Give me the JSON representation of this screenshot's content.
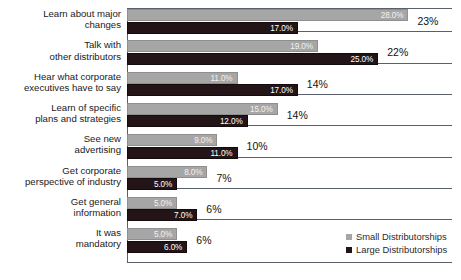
{
  "chart_data": {
    "type": "bar",
    "orientation": "horizontal",
    "title": "",
    "xlabel": "",
    "ylabel": "",
    "grid": false,
    "legend_position": "bottom-right",
    "xlim": [
      0,
      30
    ],
    "categories": [
      "Learn about major\nchanges",
      "Talk with\nother distributors",
      "Hear what corporate\nexecutives have to say",
      "Learn of specific\nplans and strategies",
      "See new\nadvertising",
      "Get corporate\nperspective of industry",
      "Get general\ninformation",
      "It was\nmandatory"
    ],
    "series": [
      {
        "name": "Small Distributorships",
        "color": "#a6a6a6",
        "values": [
          28.0,
          19.0,
          11.0,
          15.0,
          9.0,
          8.0,
          5.0,
          5.0
        ],
        "labels": [
          "28.0%",
          "19.0%",
          "11.0%",
          "15.0%",
          "9.0%",
          "8.0%",
          "5.0%",
          "5.0%"
        ]
      },
      {
        "name": "Large Distributorships",
        "color": "#231417",
        "values": [
          17.0,
          25.0,
          17.0,
          12.0,
          11.0,
          5.0,
          7.0,
          6.0
        ],
        "labels": [
          "17.0%",
          "25.0%",
          "17.0%",
          "12.0%",
          "11.0%",
          "5.0%",
          "7.0%",
          "6.0%"
        ]
      }
    ],
    "totals": [
      "23%",
      "22%",
      "14%",
      "14%",
      "10%",
      "7%",
      "6%",
      "6%"
    ]
  },
  "legend": {
    "items": [
      {
        "label": "Small Distributorships"
      },
      {
        "label": "Large Distributorships"
      }
    ]
  }
}
